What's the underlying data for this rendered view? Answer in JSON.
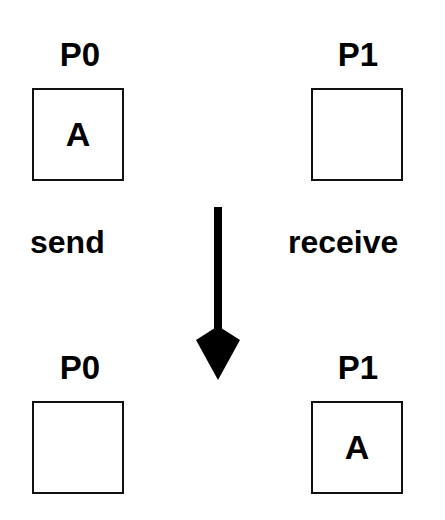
{
  "diagram": {
    "before": {
      "p0": {
        "label": "P0",
        "content": "A"
      },
      "p1": {
        "label": "P1",
        "content": ""
      }
    },
    "actions": {
      "left": "send",
      "right": "receive"
    },
    "arrow": {
      "direction": "down",
      "color": "#000000"
    },
    "after": {
      "p0": {
        "label": "P0",
        "content": ""
      },
      "p1": {
        "label": "P1",
        "content": "A"
      }
    }
  }
}
